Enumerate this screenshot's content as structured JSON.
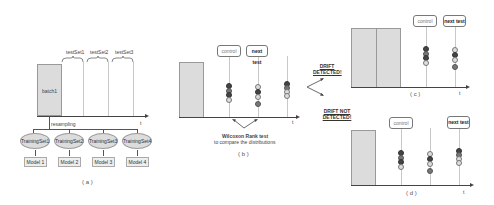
{
  "panel_a": {
    "batch_label": "batch1",
    "testsets": [
      "testSet1",
      "testSet2",
      "testSet3"
    ],
    "axis_label": "t",
    "resampling_label": "resampling",
    "training_sets": [
      "TrainingSet1",
      "TrainingSet2",
      "TrainingSet3",
      "TrainingSet4"
    ],
    "models": [
      "Model 1",
      "Model 2",
      "Model 3",
      "Model 4"
    ],
    "caption": "( a )"
  },
  "panel_b": {
    "control_label": "control",
    "next_test_label": "next test",
    "axis_label": "t",
    "annotation_line1": "Wilcoxon Rank test",
    "annotation_line2": "to compare the distributions",
    "caption": "( b )"
  },
  "branch": {
    "drift_detected": "DRIFT DETECTED!",
    "drift_not_detected": "DRIFT NOT DETECTED!"
  },
  "panel_c": {
    "control_label": "control",
    "next_test_label": "next test",
    "axis_label": "t",
    "caption": "( c )"
  },
  "panel_d": {
    "control_label": "control",
    "next_test_label": "next test",
    "axis_label": "t",
    "caption": "( d )"
  },
  "colors": {
    "batch_fill": "#dcdcdc",
    "dot_dark": "#444444",
    "dot_mid": "#777777",
    "dot_open": "#dddddd"
  }
}
